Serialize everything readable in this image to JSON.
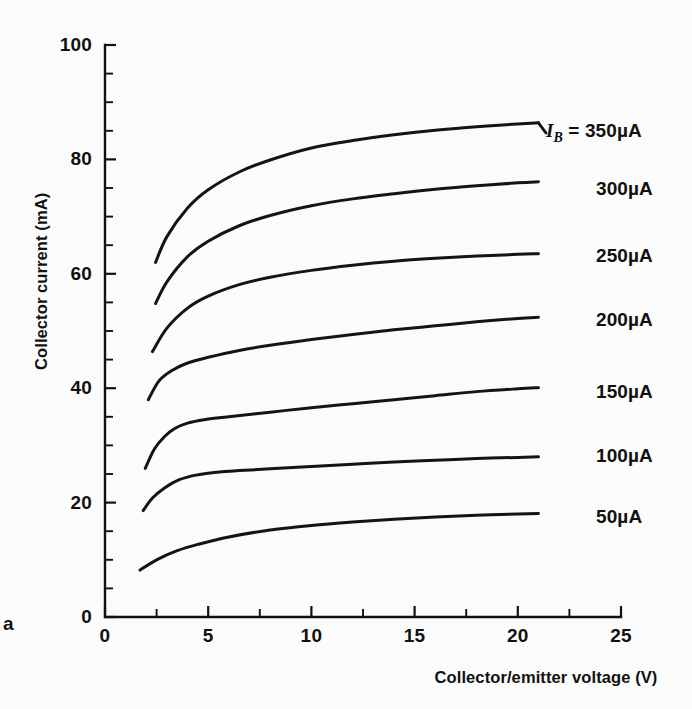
{
  "figure": {
    "tag": "a",
    "background_color": "#fbfbfb",
    "ink_color": "#141414"
  },
  "chart_data": {
    "type": "line",
    "title": "",
    "xlabel": "Collector/emitter voltage (V)",
    "ylabel": "Collector current (mA)",
    "xlim": [
      0,
      25
    ],
    "ylim": [
      0,
      100
    ],
    "xticks": [
      0,
      5,
      10,
      15,
      20,
      25
    ],
    "xtick_labels": [
      "0",
      "5",
      "10",
      "15",
      "20",
      "25"
    ],
    "x_minor_step": 2.5,
    "yticks": [
      0,
      20,
      40,
      60,
      80,
      100
    ],
    "ytick_labels": [
      "0",
      "20",
      "40",
      "60",
      "80",
      "100"
    ],
    "y_minor_step": 5,
    "grid": false,
    "legend_position": "right-inline-labels",
    "legend_prefix": "I_B =",
    "series": [
      {
        "name": "350µA",
        "label": "350µA",
        "label_prefix_symbol": "I",
        "label_prefix_subscript": "B",
        "label_prefix_equals": "=",
        "has_prefix": true,
        "x": [
          2.45,
          3.0,
          4.0,
          5.0,
          6.5,
          8.0,
          10.0,
          12.0,
          14.0,
          16.0,
          18.0,
          20.0,
          21.0
        ],
        "y": [
          62.0,
          66.5,
          71.5,
          74.7,
          77.8,
          79.9,
          82.0,
          83.3,
          84.3,
          85.1,
          85.7,
          86.2,
          86.4
        ]
      },
      {
        "name": "300µA",
        "label": "300µA",
        "has_prefix": false,
        "x": [
          2.45,
          3.0,
          4.0,
          5.0,
          6.5,
          8.0,
          10.0,
          12.0,
          14.0,
          16.0,
          18.0,
          20.0,
          21.0
        ],
        "y": [
          54.8,
          58.6,
          63.0,
          65.7,
          68.4,
          70.2,
          71.9,
          73.1,
          74.0,
          74.8,
          75.4,
          75.9,
          76.1
        ]
      },
      {
        "name": "250µA",
        "label": "250µA",
        "has_prefix": false,
        "x": [
          2.3,
          3.0,
          4.0,
          5.0,
          6.5,
          8.0,
          10.0,
          12.0,
          14.0,
          16.0,
          18.0,
          20.0,
          21.0
        ],
        "y": [
          46.4,
          50.5,
          54.0,
          56.1,
          58.1,
          59.4,
          60.6,
          61.5,
          62.2,
          62.7,
          63.1,
          63.4,
          63.5
        ]
      },
      {
        "name": "200µA",
        "label": "200µA",
        "has_prefix": false,
        "x": [
          2.1,
          2.6,
          3.2,
          4.0,
          5.0,
          6.5,
          8.0,
          10.0,
          12.0,
          14.0,
          16.0,
          18.0,
          20.0,
          21.0
        ],
        "y": [
          38.0,
          41.2,
          43.0,
          44.4,
          45.4,
          46.6,
          47.5,
          48.5,
          49.4,
          50.2,
          50.9,
          51.6,
          52.2,
          52.4
        ]
      },
      {
        "name": "150µA",
        "label": "150µA",
        "has_prefix": false,
        "x": [
          1.95,
          2.4,
          2.9,
          3.4,
          4.0,
          4.8,
          6.0,
          8.0,
          10.0,
          12.0,
          14.0,
          16.0,
          18.0,
          20.0,
          21.0
        ],
        "y": [
          26.0,
          29.4,
          31.6,
          33.0,
          33.9,
          34.5,
          35.0,
          35.8,
          36.6,
          37.3,
          38.0,
          38.7,
          39.4,
          39.9,
          40.1
        ]
      },
      {
        "name": "100µA",
        "label": "100µA",
        "has_prefix": false,
        "x": [
          1.85,
          2.3,
          2.9,
          3.6,
          4.4,
          5.4,
          6.5,
          8.0,
          10.0,
          12.0,
          14.0,
          16.0,
          18.0,
          20.0,
          21.0
        ],
        "y": [
          18.6,
          20.8,
          22.6,
          24.0,
          24.8,
          25.3,
          25.6,
          25.9,
          26.3,
          26.7,
          27.1,
          27.4,
          27.7,
          27.9,
          28.0
        ]
      },
      {
        "name": "50µA",
        "label": "50µA",
        "has_prefix": false,
        "x": [
          1.7,
          2.5,
          3.5,
          4.5,
          6.0,
          8.0,
          10.0,
          12.0,
          14.0,
          16.0,
          18.0,
          20.0,
          21.0
        ],
        "y": [
          8.2,
          10.0,
          11.6,
          12.7,
          14.0,
          15.2,
          16.0,
          16.6,
          17.1,
          17.5,
          17.8,
          18.0,
          18.1
        ]
      }
    ]
  }
}
